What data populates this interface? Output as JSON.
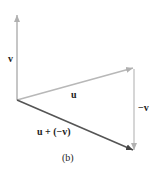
{
  "diagram": {
    "caption": "(b)",
    "vectors": [
      {
        "id": "v",
        "label": "v",
        "from": [
          17,
          100
        ],
        "to": [
          17,
          14
        ],
        "color": "#b8b8b8"
      },
      {
        "id": "u",
        "label": "u",
        "from": [
          17,
          100
        ],
        "to": [
          134,
          68
        ],
        "color": "#b8b8b8"
      },
      {
        "id": "neg-v",
        "label": "−v",
        "from": [
          134,
          68
        ],
        "to": [
          134,
          151
        ],
        "color": "#c8c8c8"
      },
      {
        "id": "u-plus-neg-v",
        "label": "u + (−v)",
        "from": [
          17,
          100
        ],
        "to": [
          134,
          151
        ],
        "color": "#555555"
      }
    ],
    "labels": {
      "v": "v",
      "u": "u",
      "neg_v": "−v",
      "sum": "u + (−v)",
      "caption": "(b)"
    }
  }
}
